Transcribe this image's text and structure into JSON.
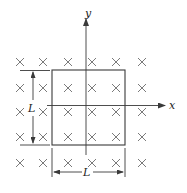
{
  "figure": {
    "axes": {
      "x_label": "x",
      "y_label": "y"
    },
    "square": {
      "side_label_vertical": "L",
      "side_label_horizontal": "L"
    },
    "field": {
      "symbol": "×",
      "direction": "into page",
      "rows": 5,
      "columns": 6
    },
    "colors": {
      "field_marks": "#6b6b6b",
      "lines": "#3a3a3a",
      "background": "#ffffff"
    }
  }
}
